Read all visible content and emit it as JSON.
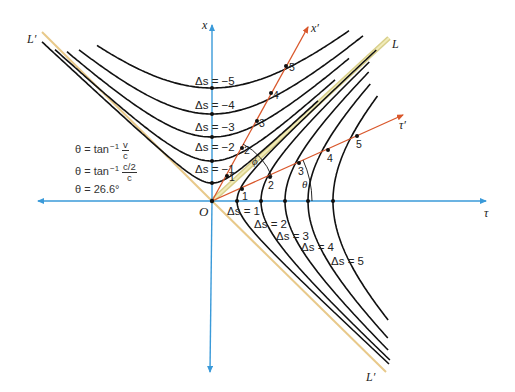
{
  "diagram": {
    "type": "spacetime-hyperbola-diagram",
    "axes": {
      "tau_label": "τ",
      "x_label": "x",
      "tau_prime_label": "τ′",
      "x_prime_label": "x′",
      "origin_label": "O",
      "light_cone_label": "L",
      "light_cone_prime_upper_label": "L′",
      "light_cone_prime_lower_label": "L′"
    },
    "hyperbolas_spacelike": [
      {
        "label": "Δs = 1"
      },
      {
        "label": "Δs = 2"
      },
      {
        "label": "Δs = 3"
      },
      {
        "label": "Δs = 4"
      },
      {
        "label": "Δs = 5"
      }
    ],
    "hyperbolas_timelike": [
      {
        "label": "Δs = −1"
      },
      {
        "label": "Δs = −2"
      },
      {
        "label": "Δs = −3"
      },
      {
        "label": "Δs = −4"
      },
      {
        "label": "Δs = −5"
      }
    ],
    "x_prime_ticks": [
      "1",
      "2",
      "3",
      "4",
      "5"
    ],
    "tau_prime_ticks": [
      "1",
      "2",
      "3",
      "4",
      "5"
    ],
    "angles": {
      "theta": "θ",
      "phi": "ϕ"
    },
    "equations": {
      "line1_lhs": "θ = tan",
      "line1_sup": "−1",
      "line1_num": "v",
      "line1_den": "c",
      "line2_lhs": "θ = tan",
      "line2_sup": "−1",
      "line2_num": "c/2",
      "line2_den": "c",
      "line3": "θ = 26.6°"
    },
    "colors": {
      "axis": "#3a9ad9",
      "primed_axis": "#d9572b",
      "light_cone": "#e8c98a",
      "light_cone_fill": "#d8cf8a",
      "hyperbola": "#111111"
    }
  }
}
